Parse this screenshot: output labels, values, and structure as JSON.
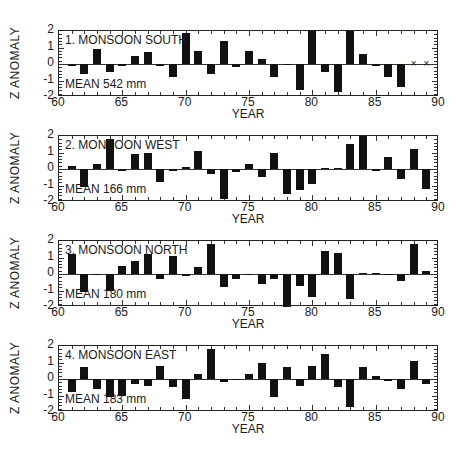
{
  "chart_data": [
    {
      "type": "bar",
      "title": "1. MONSOON SOUTH",
      "annotation": "MEAN 542 mm",
      "xlabel": "YEAR",
      "ylabel": "Z ANOMALY",
      "xlim": [
        60,
        90
      ],
      "ylim": [
        -2,
        2
      ],
      "xticks": [
        60,
        65,
        70,
        75,
        80,
        85,
        90
      ],
      "yticks": [
        -2,
        -1,
        0,
        1,
        2
      ],
      "x": [
        61,
        62,
        63,
        64,
        65,
        66,
        67,
        68,
        69,
        70,
        71,
        72,
        73,
        74,
        75,
        76,
        77,
        78,
        79,
        80,
        81,
        82,
        83,
        84,
        85,
        86,
        87,
        88,
        89
      ],
      "values": [
        -0.1,
        -0.6,
        0.9,
        -0.5,
        -0.1,
        0.5,
        0.7,
        -0.1,
        -0.8,
        1.9,
        0.8,
        -0.6,
        1.4,
        -0.2,
        0.8,
        0.3,
        -0.8,
        -0.05,
        -1.6,
        2.0,
        -0.5,
        -1.7,
        2.0,
        0.6,
        -0.1,
        -0.8,
        -1.4,
        null,
        null
      ],
      "missing_markers": [
        88,
        89
      ]
    },
    {
      "type": "bar",
      "title": "2. MONSOON WEST",
      "annotation": "MEAN 166 mm",
      "xlabel": "YEAR",
      "ylabel": "Z ANOMALY",
      "xlim": [
        60,
        90
      ],
      "ylim": [
        -2,
        2
      ],
      "xticks": [
        60,
        65,
        70,
        75,
        80,
        85,
        90
      ],
      "yticks": [
        -2,
        -1,
        0,
        1,
        2
      ],
      "x": [
        61,
        62,
        63,
        64,
        65,
        66,
        67,
        68,
        69,
        70,
        71,
        72,
        73,
        74,
        75,
        76,
        77,
        78,
        79,
        80,
        81,
        82,
        83,
        84,
        85,
        86,
        87,
        88,
        89
      ],
      "values": [
        0.2,
        -1.1,
        0.3,
        1.8,
        -0.1,
        0.9,
        1.0,
        -0.8,
        -0.1,
        0.1,
        1.1,
        -0.3,
        -1.8,
        -0.2,
        0.3,
        -0.5,
        1.0,
        -1.5,
        -1.3,
        -0.9,
        0.05,
        0.05,
        1.5,
        2.1,
        -0.1,
        0.7,
        -0.6,
        1.2,
        -1.2
      ]
    },
    {
      "type": "bar",
      "title": "3. MONSOON NORTH",
      "annotation": "MEAN 180 mm",
      "xlabel": "YEAR",
      "ylabel": "Z ANOMALY",
      "xlim": [
        60,
        90
      ],
      "ylim": [
        -2,
        2
      ],
      "xticks": [
        60,
        65,
        70,
        75,
        80,
        85,
        90
      ],
      "yticks": [
        -2,
        -1,
        0,
        1,
        2
      ],
      "x": [
        61,
        62,
        63,
        64,
        65,
        66,
        67,
        68,
        69,
        70,
        71,
        72,
        73,
        74,
        75,
        76,
        77,
        78,
        79,
        80,
        81,
        82,
        83,
        84,
        85,
        86,
        87,
        88,
        89
      ],
      "values": [
        1.2,
        -1.1,
        0.0,
        -1.0,
        0.5,
        0.8,
        1.2,
        -0.3,
        1.1,
        -0.1,
        0.4,
        1.8,
        -0.8,
        -0.3,
        0.0,
        -0.6,
        -0.3,
        -2.0,
        -0.7,
        -1.4,
        1.4,
        1.3,
        -1.5,
        0.05,
        0.05,
        0.0,
        -0.4,
        1.8,
        0.2
      ]
    },
    {
      "type": "bar",
      "title": "4. MONSOON EAST",
      "annotation": "MEAN 183 mm",
      "xlabel": "YEAR",
      "ylabel": "Z ANOMALY",
      "xlim": [
        60,
        90
      ],
      "ylim": [
        -2,
        2
      ],
      "xticks": [
        60,
        65,
        70,
        75,
        80,
        85,
        90
      ],
      "yticks": [
        -2,
        -1,
        0,
        1,
        2
      ],
      "x": [
        61,
        62,
        63,
        64,
        65,
        66,
        67,
        68,
        69,
        70,
        71,
        72,
        73,
        74,
        75,
        76,
        77,
        78,
        79,
        80,
        81,
        82,
        83,
        84,
        85,
        86,
        87,
        88,
        89
      ],
      "values": [
        -0.8,
        0.7,
        -0.6,
        -1.1,
        -1.0,
        -0.3,
        -0.4,
        0.8,
        -0.5,
        -1.2,
        0.3,
        1.8,
        -0.2,
        0.0,
        0.3,
        1.0,
        -1.1,
        0.7,
        -0.4,
        0.8,
        1.5,
        -0.5,
        -1.7,
        0.7,
        0.2,
        -0.1,
        -0.6,
        1.1,
        -0.3
      ]
    }
  ],
  "panels": [
    {
      "title": "1. MONSOON SOUTH",
      "mean": "MEAN 542 mm",
      "ylabel": "Z ANOMALY",
      "xlabel": "YEAR"
    },
    {
      "title": "2. MONSOON WEST",
      "mean": "MEAN 166 mm",
      "ylabel": "Z ANOMALY",
      "xlabel": "YEAR"
    },
    {
      "title": "3. MONSOON NORTH",
      "mean": "MEAN 180 mm",
      "ylabel": "Z ANOMALY",
      "xlabel": "YEAR"
    },
    {
      "title": "4. MONSOON EAST",
      "mean": "MEAN 183 mm",
      "ylabel": "Z ANOMALY",
      "xlabel": "YEAR"
    }
  ],
  "ytick_labels": [
    "2",
    "1",
    "0",
    "-1",
    "-2"
  ],
  "xtick_labels": [
    "60",
    "65",
    "70",
    "75",
    "80",
    "85",
    "90"
  ],
  "missing_marker": "×"
}
